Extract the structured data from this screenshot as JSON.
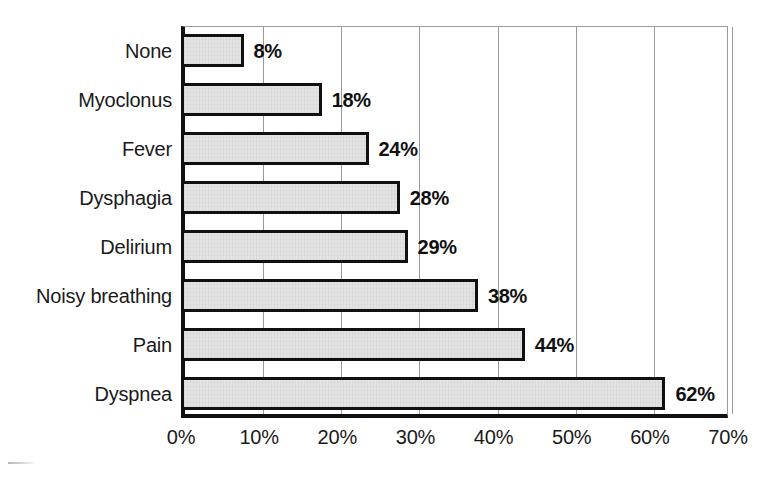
{
  "chart_data": {
    "type": "bar",
    "orientation": "horizontal",
    "title": "",
    "subtitle": "",
    "xlabel": "",
    "ylabel": "",
    "categories": [
      "Dyspnea",
      "Pain",
      "Noisy breathing",
      "Delirium",
      "Dysphagia",
      "Fever",
      "Myoclonus",
      "None"
    ],
    "values": [
      62,
      44,
      38,
      29,
      28,
      24,
      18,
      8
    ],
    "value_labels": [
      "62%",
      "44%",
      "38%",
      "29%",
      "28%",
      "24%",
      "18%",
      "8%"
    ],
    "display_order_top_to_bottom": [
      "None",
      "Myoclonus",
      "Fever",
      "Dysphagia",
      "Delirium",
      "Noisy breathing",
      "Pain",
      "Dyspnea"
    ],
    "xlim": [
      0,
      70
    ],
    "xticks": [
      0,
      10,
      20,
      30,
      40,
      50,
      60,
      70
    ],
    "xtick_labels": [
      "0%",
      "10%",
      "20%",
      "30%",
      "40%",
      "50%",
      "60%",
      "70%"
    ],
    "grid": "vertical",
    "legend": "none",
    "bar_fill_color": "#e3e3e3",
    "bar_border_color": "#101010",
    "gridline_color": "#9a9a9a",
    "axis_color": "#111111",
    "background_color": "#ffffff"
  },
  "series_top_to_bottom": [
    {
      "label": "None",
      "value": 8,
      "value_label": "8%"
    },
    {
      "label": "Myoclonus",
      "value": 18,
      "value_label": "18%"
    },
    {
      "label": "Fever",
      "value": 24,
      "value_label": "24%"
    },
    {
      "label": "Dysphagia",
      "value": 28,
      "value_label": "28%"
    },
    {
      "label": "Delirium",
      "value": 29,
      "value_label": "29%"
    },
    {
      "label": "Noisy breathing",
      "value": 38,
      "value_label": "38%"
    },
    {
      "label": "Pain",
      "value": 44,
      "value_label": "44%"
    },
    {
      "label": "Dyspnea",
      "value": 62,
      "value_label": "62%"
    }
  ]
}
